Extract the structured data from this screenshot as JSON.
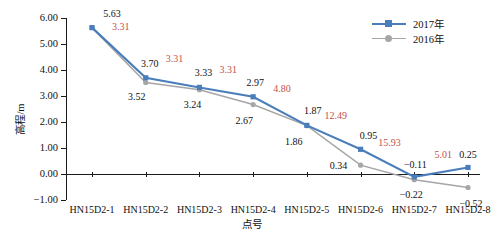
{
  "chart_data": {
    "type": "line",
    "title": "",
    "xlabel": "点号",
    "ylabel": "高程/m",
    "ylim": [
      -1.0,
      6.0
    ],
    "yticks": [
      "6.00",
      "5.00",
      "4.00",
      "3.00",
      "2.00",
      "1.00",
      "0.00",
      "-1.00"
    ],
    "grid": false,
    "legend_position": "top-right",
    "categories": [
      "HN15D2-1",
      "HN15D2-2",
      "HN15D2-3",
      "HN15D2-4",
      "HN15D2-5",
      "HN15D2-6",
      "HN15D2-7",
      "HN15D2-8"
    ],
    "series": [
      {
        "name": "2017年",
        "color": "#4a7ebb",
        "marker": "square",
        "values": [
          5.63,
          3.7,
          3.33,
          2.97,
          1.87,
          0.95,
          -0.11,
          0.25
        ],
        "labels": [
          "5.63",
          "3.70",
          "3.33",
          "2.97",
          "1.87",
          "0.95",
          "-0.11",
          "0.25"
        ]
      },
      {
        "name": "2016年",
        "color": "#a6a6a6",
        "marker": "circle",
        "values": [
          5.63,
          3.52,
          3.24,
          2.67,
          1.86,
          0.34,
          -0.22,
          -0.52
        ],
        "labels": [
          "5.63",
          "3.52",
          "3.24",
          "2.67",
          "1.86",
          "0.34",
          "-0.22",
          "-0.52"
        ]
      }
    ],
    "annotations": {
      "color": "#c0504d",
      "values": [
        "3.31",
        "3.31",
        "3.31",
        "4.80",
        "12.49",
        "15.93",
        "5.01"
      ]
    }
  },
  "legend": {
    "items": [
      {
        "label": "2017年",
        "color": "#4a7ebb"
      },
      {
        "label": "2016年",
        "color": "#a6a6a6"
      }
    ]
  }
}
